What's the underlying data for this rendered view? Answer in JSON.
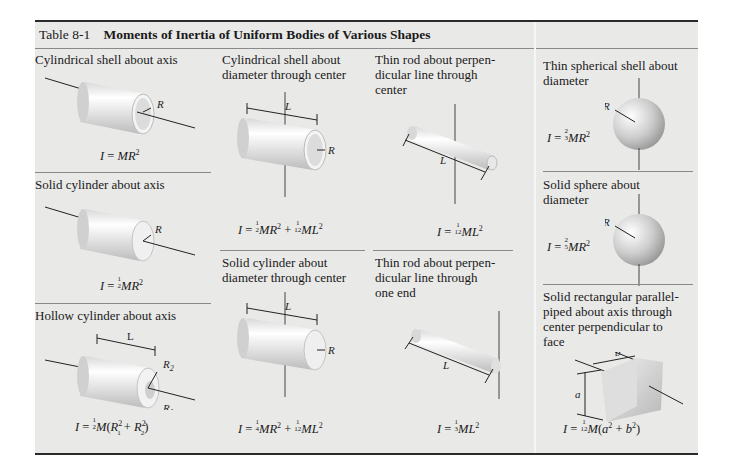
{
  "table": {
    "number": "Table 8-1",
    "title": "Moments of Inertia of Uniform Bodies of Various Shapes",
    "background_color": "#e9e9e8",
    "border_color": "#2a2a2a"
  },
  "cells": [
    {
      "id": "cyl-shell-axis",
      "title": "Cylindrical shell about axis",
      "formula": "I = MR²",
      "labels": [
        "R"
      ]
    },
    {
      "id": "solid-cyl-axis",
      "title": "Solid cylinder about axis",
      "formula": "I = ½MR²",
      "labels": [
        "R"
      ]
    },
    {
      "id": "hollow-cyl-axis",
      "title": "Hollow cylinder about axis",
      "formula": "I = ½M(R₁² + R₂²)",
      "labels": [
        "L",
        "R₂",
        "R₁"
      ]
    },
    {
      "id": "cyl-shell-diam",
      "title": "Cylindrical shell about diameter through center",
      "formula": "I = ½MR² + 1/12 ML²",
      "labels": [
        "L",
        "R"
      ]
    },
    {
      "id": "solid-cyl-diam",
      "title": "Solid cylinder about diameter through center",
      "formula": "I = ¼MR² + 1/12 ML²",
      "labels": [
        "L",
        "R"
      ]
    },
    {
      "id": "rod-center",
      "title": "Thin rod about perpendicular line through center",
      "formula": "I = 1/12 ML²",
      "labels": [
        "L"
      ]
    },
    {
      "id": "rod-end",
      "title": "Thin rod about perpendicular line through one end",
      "formula": "I = ⅓ML²",
      "labels": [
        "L"
      ]
    },
    {
      "id": "sph-shell",
      "title": "Thin spherical shell about diameter",
      "formula": "I = ⅔MR²",
      "labels": [
        "R"
      ]
    },
    {
      "id": "solid-sphere",
      "title": "Solid sphere about diameter",
      "formula": "I = ⅖MR²",
      "labels": [
        "R"
      ]
    },
    {
      "id": "rect-plate",
      "title": "Solid rectangular parallelpiped about axis through center perpendicular to face",
      "formula": "I = 1/12 M(a² + b²)",
      "labels": [
        "a",
        "b"
      ]
    }
  ],
  "display": {
    "t1a": "Cylindrical shell about axis",
    "t1b": "Solid cylinder about axis",
    "t1c": "Hollow cylinder about axis",
    "t2a_1": "Cylindrical shell about",
    "t2a_2": "diameter through center",
    "t2b_1": "Solid cylinder about",
    "t2b_2": "diameter through center",
    "t3a_1": "Thin rod about perpen-",
    "t3a_2": "dicular line through",
    "t3a_3": "center",
    "t3b_1": "Thin rod about perpen-",
    "t3b_2": "dicular line through",
    "t3b_3": "one end",
    "t4a_1": "Thin spherical shell about",
    "t4a_2": "diameter",
    "t4b_1": "Solid sphere about",
    "t4b_2": "diameter",
    "t4c_1": "Solid rectangular parallel-",
    "t4c_2": "piped about axis through",
    "t4c_3": "center perpendicular to",
    "t4c_4": "face",
    "I": "I",
    "eq": " = ",
    "M": "M",
    "MR": "MR",
    "ML": "ML",
    "plus": " + ",
    "two": "2",
    "one": "1",
    "three": "3",
    "four": "4",
    "five": "5",
    "twelve": "12",
    "R": "R",
    "L": "L",
    "a": "a",
    "b": "b",
    "R1": "R",
    "R2": "R",
    "sub1": "1",
    "sub2": "2",
    "lp": "(",
    "rp": ")"
  }
}
